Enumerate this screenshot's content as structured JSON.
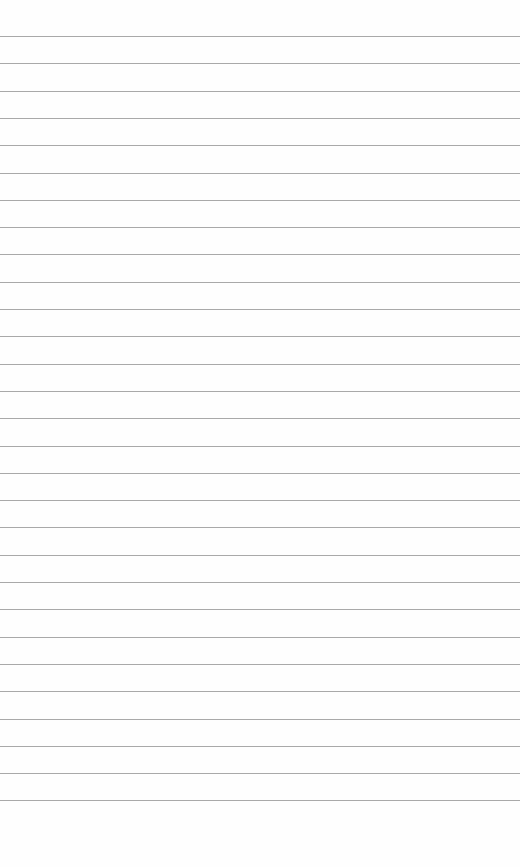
{
  "page": {
    "width": 520,
    "height": 867,
    "background": "#fefefe"
  },
  "ruled_lines": {
    "count": 29,
    "first_y": 36,
    "spacing": 27.3,
    "color": "#9a9a9a"
  }
}
